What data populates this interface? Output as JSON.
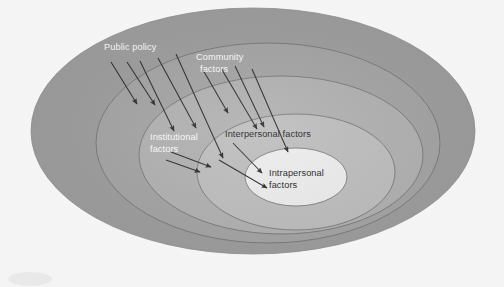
{
  "diagram": {
    "type": "social-ecological-model",
    "background_color": "#ffffff",
    "rings": [
      {
        "id": "public-policy",
        "label": "Public policy",
        "label_lines": [
          "Public policy"
        ],
        "label_color": "#fdfdfd",
        "fill": "#9c9c9c",
        "stroke": "#8f8f8f",
        "level": 1,
        "label_position": {
          "x": 104,
          "y": 50
        },
        "ellipse": {
          "cx": 253,
          "cy": 131,
          "rx": 222,
          "ry": 123
        }
      },
      {
        "id": "community-factors",
        "label": "Community factors",
        "label_lines": [
          "Community",
          "factors"
        ],
        "label_color": "#fdfdfd",
        "fill": "#a3a3a3",
        "stroke": "#6e6e6e",
        "level": 2,
        "label_position": {
          "x": 196,
          "y": 60
        },
        "ellipse": {
          "cx": 268,
          "cy": 143,
          "rx": 172,
          "ry": 100
        }
      },
      {
        "id": "institutional-factors",
        "label": "Institutional factors",
        "label_lines": [
          "Institutional",
          "factors"
        ],
        "label_color": "#f2f2f2",
        "fill": "#b0b0b0",
        "stroke": "#6e6e6e",
        "level": 3,
        "label_position": {
          "x": 150,
          "y": 140
        },
        "ellipse": {
          "cx": 281,
          "cy": 155,
          "rx": 142,
          "ry": 79
        }
      },
      {
        "id": "interpersonal-factors",
        "label": "Interpersonal factors",
        "label_lines": [
          "Interpersonal factors"
        ],
        "label_color": "#1d1d1d",
        "fill": "#bdbdbd",
        "stroke": "#6e6e6e",
        "level": 4,
        "label_position": {
          "x": 225,
          "y": 137
        },
        "ellipse": {
          "cx": 296,
          "cy": 172,
          "rx": 99,
          "ry": 58
        }
      },
      {
        "id": "intrapersonal-factors",
        "label": "Intrapersonal factors",
        "label_lines": [
          "Intrapersonal",
          "factors"
        ],
        "label_color": "#1d1d1d",
        "fill": "#ededed",
        "stroke": "#6e6e6e",
        "level": 5,
        "label_position": {
          "x": 269,
          "y": 176
        },
        "ellipse": {
          "cx": 296,
          "cy": 177,
          "rx": 51,
          "ry": 29
        }
      }
    ],
    "arrows": {
      "color": "#2a2a2a",
      "count": 13,
      "description": "Thin straight arrows angled down-right pointing inward from outer rings toward the centre",
      "lines": [
        {
          "x1": 111,
          "y1": 62,
          "x2": 137,
          "y2": 104
        },
        {
          "x1": 127,
          "y1": 62,
          "x2": 155,
          "y2": 105
        },
        {
          "x1": 140,
          "y1": 61,
          "x2": 174,
          "y2": 131
        },
        {
          "x1": 158,
          "y1": 58,
          "x2": 196,
          "y2": 128
        },
        {
          "x1": 176,
          "y1": 54,
          "x2": 223,
          "y2": 158
        },
        {
          "x1": 203,
          "y1": 70,
          "x2": 228,
          "y2": 113
        },
        {
          "x1": 221,
          "y1": 68,
          "x2": 257,
          "y2": 129
        },
        {
          "x1": 235,
          "y1": 66,
          "x2": 264,
          "y2": 127
        },
        {
          "x1": 252,
          "y1": 69,
          "x2": 288,
          "y2": 152
        },
        {
          "x1": 171,
          "y1": 152,
          "x2": 211,
          "y2": 167
        },
        {
          "x1": 166,
          "y1": 160,
          "x2": 200,
          "y2": 172
        },
        {
          "x1": 233,
          "y1": 143,
          "x2": 262,
          "y2": 173
        },
        {
          "x1": 219,
          "y1": 160,
          "x2": 267,
          "y2": 188
        }
      ]
    }
  }
}
